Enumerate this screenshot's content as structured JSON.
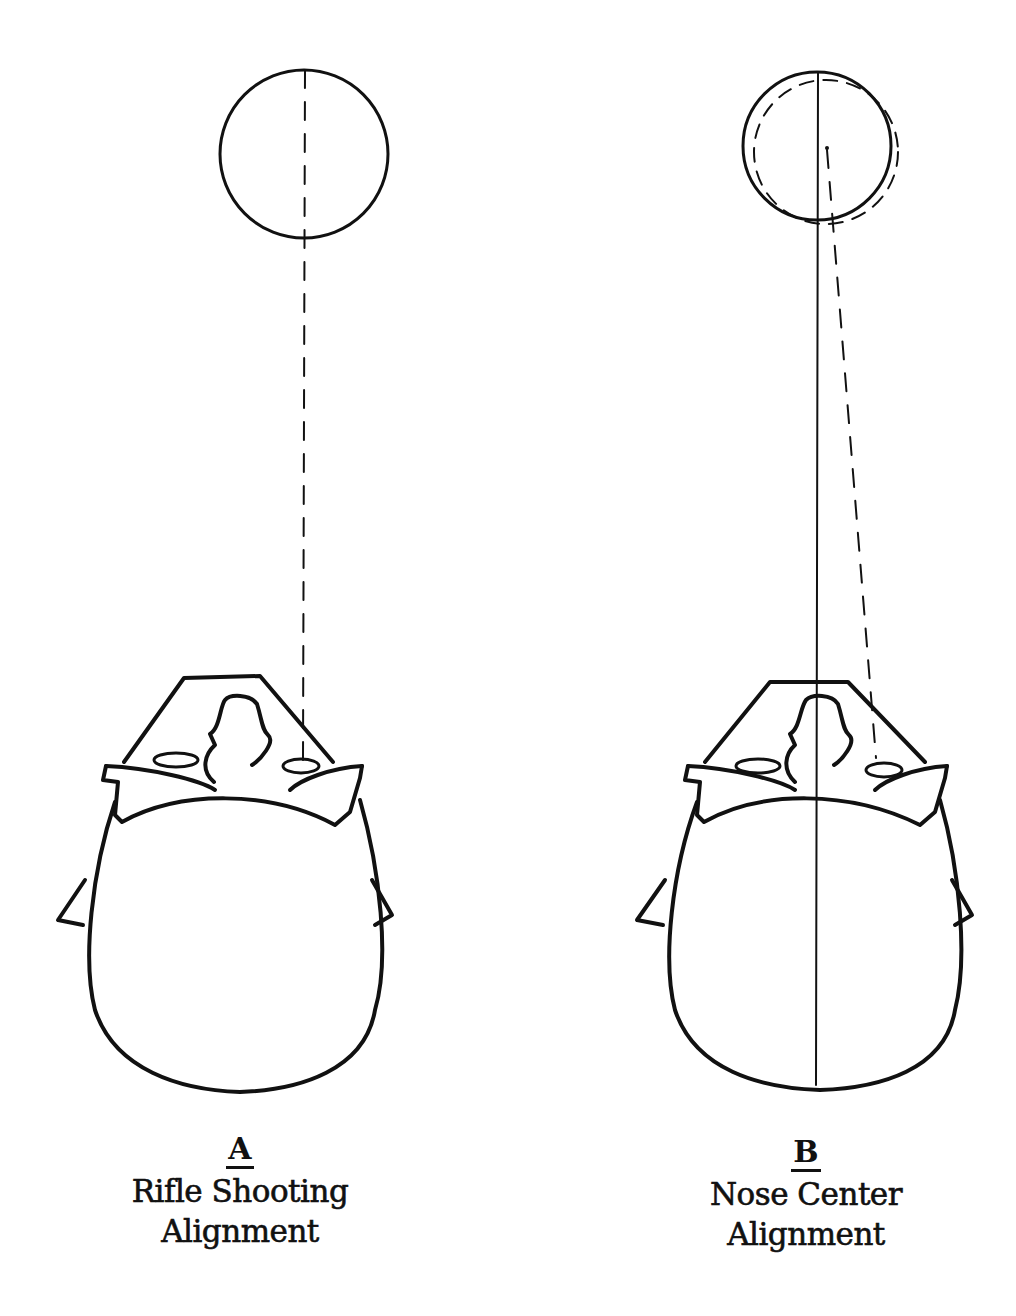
{
  "panels": [
    {
      "letter": "A",
      "title_line1": "Rifle Shooting",
      "title_line2": "Alignment",
      "target": "single circle with dashed sight line from eye to target center"
    },
    {
      "letter": "B",
      "title_line1": "Nose Center",
      "title_line2": "Alignment",
      "target": "solid circle with offset dashed circle; solid center line through nose, dashed line from eye"
    }
  ],
  "colors": {
    "ink": "#111111",
    "background": "#ffffff"
  }
}
